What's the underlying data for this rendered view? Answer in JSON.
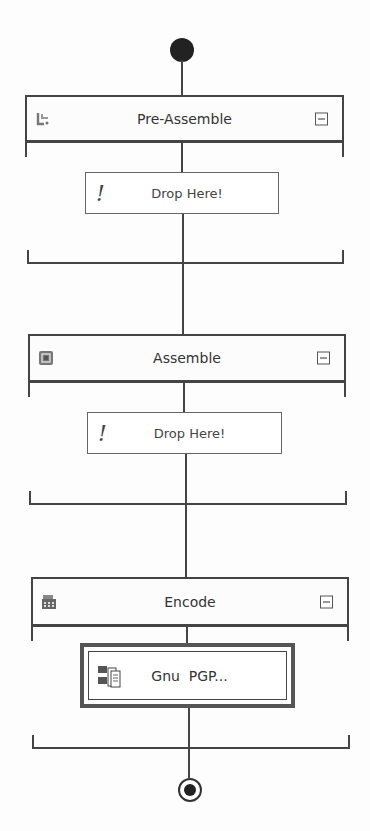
{
  "pipeline": {
    "start_node": "start-node",
    "end_node": "end-node",
    "stages": [
      {
        "name": "Pre-Assemble",
        "icon": "pre-assemble-icon",
        "collapse_icon": "collapse-icon",
        "components": [
          {
            "label": "Drop Here!",
            "icon": "exclamation-icon",
            "type": "drop-target"
          }
        ]
      },
      {
        "name": "Assemble",
        "icon": "assemble-icon",
        "collapse_icon": "collapse-icon",
        "components": [
          {
            "label": "Drop Here!",
            "icon": "exclamation-icon",
            "type": "drop-target"
          }
        ]
      },
      {
        "name": "Encode",
        "icon": "encode-icon",
        "collapse_icon": "collapse-icon",
        "components": [
          {
            "label": "Gnu  PGP...",
            "icon": "gnupg-component-icon",
            "type": "component",
            "selected": true
          }
        ]
      }
    ]
  }
}
